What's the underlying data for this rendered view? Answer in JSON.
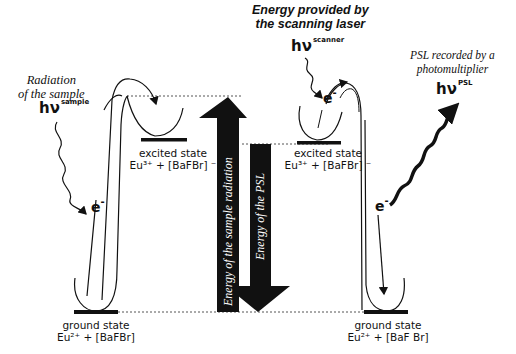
{
  "diagram": {
    "title_labels": {
      "sample_radiation": [
        "Radiation",
        "of the sample"
      ],
      "scanner_energy": [
        "Energy provided by",
        "the scanning laser"
      ],
      "psl_recorded": [
        "PSL recorded by a",
        "photomultiplier"
      ]
    },
    "photons": {
      "sample": {
        "base": "hν",
        "sup": "sample"
      },
      "scanner": {
        "base": "hν",
        "sup": "scanner"
      },
      "psl": {
        "base": "hν",
        "sup": "PSL"
      }
    },
    "electron": {
      "base": "e",
      "sup": "-"
    },
    "states": {
      "left_excited": {
        "name": "excited state",
        "formula": "Eu³⁺ + [BaFBr] ⁻"
      },
      "left_ground": {
        "name": "ground state",
        "formula": "Eu²⁺ + [BaFBr]"
      },
      "right_excited": {
        "name": "excited state",
        "formula": "Eu³⁺ + [BaFBr] ⁻"
      },
      "right_ground": {
        "name": "ground state",
        "formula": "Eu²⁺  +  [BaF Br]"
      }
    },
    "energy_arrows": {
      "up": "Energy of the sample radiation",
      "down": "Energy of the PSL"
    },
    "colors": {
      "ink": "#111111",
      "background": "#ffffff",
      "dotted": "#555555"
    }
  }
}
